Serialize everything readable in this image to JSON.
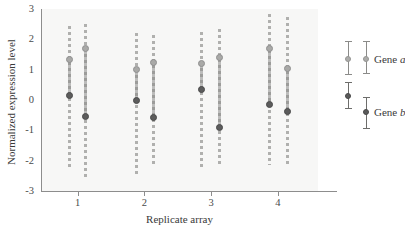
{
  "chart_data": {
    "type": "scatter",
    "title": "",
    "xlabel": "Replicate array",
    "ylabel": "Normalized expression level",
    "xtick_labels": [
      "1",
      "2",
      "3",
      "4"
    ],
    "xtick_values": [
      1,
      2,
      3,
      4
    ],
    "ytick_labels": [
      "3",
      "2",
      "1",
      "0",
      "-1",
      "-2",
      "-3"
    ],
    "ytick_values": [
      3,
      2,
      1,
      0,
      -1,
      -2,
      -3
    ],
    "ylim": [
      -3,
      3
    ],
    "xlim": [
      0.45,
      4.6
    ],
    "grid": false,
    "legend_position": "right",
    "error_bar_style": "dashed",
    "colors": {
      "gene_a": "#a9a9a7",
      "gene_b": "#5c5c5c",
      "axis": "#8d8d8d",
      "plot_background": "#f7f7f6"
    },
    "series": [
      {
        "name": "Gene a",
        "name_prefix": "Gene",
        "name_italic": "a",
        "color": "#a9a9a7",
        "points": [
          {
            "replicate": 1,
            "column": "left",
            "x": 0.88,
            "y": 1.35,
            "err_low": -2.25,
            "err_high": 2.45
          },
          {
            "replicate": 1,
            "column": "right",
            "x": 1.12,
            "y": 1.7,
            "err_low": -2.65,
            "err_high": 2.5
          },
          {
            "replicate": 2,
            "column": "left",
            "x": 1.88,
            "y": 1.0,
            "err_low": -2.55,
            "err_high": 2.2
          },
          {
            "replicate": 2,
            "column": "right",
            "x": 2.13,
            "y": 1.25,
            "err_low": -2.2,
            "err_high": 2.15
          },
          {
            "replicate": 3,
            "column": "left",
            "x": 2.85,
            "y": 1.2,
            "err_low": -2.3,
            "err_high": 2.25
          },
          {
            "replicate": 3,
            "column": "right",
            "x": 3.12,
            "y": 1.4,
            "err_low": -2.15,
            "err_high": 2.35
          },
          {
            "replicate": 4,
            "column": "left",
            "x": 3.88,
            "y": 1.7,
            "err_low": -2.15,
            "err_high": 2.85
          },
          {
            "replicate": 4,
            "column": "right",
            "x": 4.15,
            "y": 1.05,
            "err_low": -2.2,
            "err_high": 2.75
          }
        ]
      },
      {
        "name": "Gene b",
        "name_prefix": "Gene",
        "name_italic": "b",
        "color": "#5c5c5c",
        "points": [
          {
            "replicate": 1,
            "column": "left",
            "x": 0.88,
            "y": 0.15,
            "err_low": -2.25,
            "err_high": 2.45
          },
          {
            "replicate": 1,
            "column": "right",
            "x": 1.12,
            "y": -0.55,
            "err_low": -2.65,
            "err_high": 2.5
          },
          {
            "replicate": 2,
            "column": "left",
            "x": 1.88,
            "y": 0.0,
            "err_low": -2.55,
            "err_high": 2.2
          },
          {
            "replicate": 2,
            "column": "right",
            "x": 2.13,
            "y": -0.58,
            "err_low": -2.2,
            "err_high": 2.15
          },
          {
            "replicate": 3,
            "column": "left",
            "x": 2.85,
            "y": 0.35,
            "err_low": -2.3,
            "err_high": 2.25
          },
          {
            "replicate": 3,
            "column": "right",
            "x": 3.12,
            "y": -0.9,
            "err_low": -2.15,
            "err_high": 2.35
          },
          {
            "replicate": 4,
            "column": "left",
            "x": 3.88,
            "y": -0.15,
            "err_low": -2.15,
            "err_high": 2.85
          },
          {
            "replicate": 4,
            "column": "right",
            "x": 4.15,
            "y": -0.37,
            "err_low": -2.2,
            "err_high": 2.75
          }
        ]
      }
    ],
    "legend_items": [
      {
        "label_prefix": "Gene",
        "label_italic": "a",
        "series": "Gene a",
        "color": "#a9a9a7",
        "entries": [
          {
            "y": 1.35,
            "err_low": 0.85,
            "err_high": 1.95
          },
          {
            "y": 1.35,
            "err_low": 0.9,
            "err_high": 1.95
          }
        ]
      },
      {
        "label_prefix": "Gene",
        "label_italic": "b",
        "series": "Gene b",
        "color": "#5c5c5c",
        "entries": [
          {
            "y": 0.12,
            "err_low": -0.28,
            "err_high": 0.58
          },
          {
            "y": -0.38,
            "err_low": -0.92,
            "err_high": 0.1
          }
        ]
      }
    ]
  }
}
